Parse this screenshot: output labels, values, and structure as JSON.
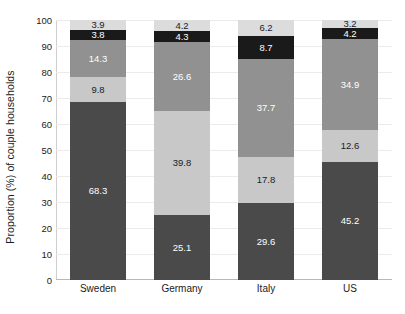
{
  "chart_data": {
    "type": "bar",
    "subtype": "stacked-bar-vertical-100pct",
    "title": "",
    "xlabel": "",
    "ylabel": "Proportion (%) of couple households",
    "ylim": [
      0,
      100
    ],
    "yticks": [
      0,
      10,
      20,
      30,
      40,
      50,
      60,
      70,
      80,
      90,
      100
    ],
    "ytick_labels": [
      "0",
      "10",
      "20",
      "30",
      "40",
      "50",
      "60",
      "70",
      "80",
      "90",
      "100"
    ],
    "grid": true,
    "legend": false,
    "categories": [
      "Sweden",
      "Germany",
      "Italy",
      "US"
    ],
    "series": [
      {
        "name": "segment-1",
        "order": 1,
        "color": "#4a4a4a",
        "text_color": "#ffffff",
        "values": [
          68.3,
          25.1,
          29.6,
          45.2
        ],
        "labels": [
          "68.3",
          "25.1",
          "29.6",
          "45.2"
        ]
      },
      {
        "name": "segment-2",
        "order": 2,
        "color": "#c8c8c8",
        "text_color": "#1b1b1b",
        "values": [
          9.8,
          39.8,
          17.8,
          12.6
        ],
        "labels": [
          "9.8",
          "39.8",
          "17.8",
          "12.6"
        ]
      },
      {
        "name": "segment-3",
        "order": 3,
        "color": "#919191",
        "text_color": "#ffffff",
        "values": [
          14.3,
          26.6,
          37.7,
          34.9
        ],
        "labels": [
          "14.3",
          "26.6",
          "37.7",
          "34.9"
        ]
      },
      {
        "name": "segment-4",
        "order": 4,
        "color": "#1a1a1a",
        "text_color": "#ffffff",
        "values": [
          3.8,
          4.3,
          8.7,
          4.2
        ],
        "labels": [
          "3.8",
          "4.3",
          "8.7",
          "4.2"
        ]
      },
      {
        "name": "segment-5",
        "order": 5,
        "color": "#dcdcdc",
        "text_color": "#1b1b1b",
        "values": [
          3.9,
          4.2,
          6.2,
          3.2
        ],
        "labels": [
          "3.9",
          "4.2",
          "6.2",
          "3.2"
        ]
      }
    ],
    "totals": [
      100.1,
      100.0,
      100.0,
      100.1
    ],
    "colors": {
      "grid": "#ebebeb",
      "axis": "#cfcfcf",
      "baseline": "#b8b8b8",
      "background": "#ffffff",
      "text": "#1b1b1b"
    }
  }
}
